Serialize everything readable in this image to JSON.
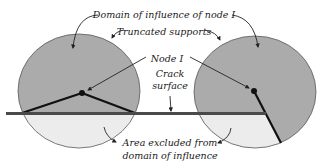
{
  "diagram": {
    "labels": {
      "domain_of_influence": "Domain of influence of node I",
      "truncated_supports": "Truncated supports",
      "node": "Node I",
      "crack_line1": "Crack",
      "crack_line2": "surface",
      "excluded_line1": "Area excluded from",
      "excluded_line2": "domain of influence"
    },
    "colors": {
      "support_fill": "#ababab",
      "excluded_fill": "#ececec",
      "crack": "#4a4a4a",
      "ray": "#111111",
      "outline": "#5a5a5a"
    }
  }
}
